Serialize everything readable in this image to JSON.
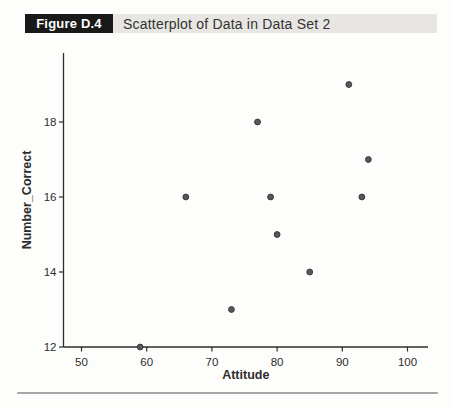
{
  "figure": {
    "label": "Figure D.4",
    "title": "Scatterplot of Data in Data Set 2"
  },
  "chart_data": {
    "type": "scatter",
    "title": "Scatterplot of Data in Data Set 2",
    "xlabel": "Attitude",
    "ylabel": "Number_Correct",
    "xlim": [
      47.2,
      103.2
    ],
    "ylim": [
      12,
      19.85
    ],
    "x_ticks": [
      50,
      60,
      70,
      80,
      90,
      100
    ],
    "y_ticks": [
      12,
      14,
      16,
      18
    ],
    "grid": false,
    "legend": "none",
    "points": [
      {
        "x": 59,
        "y": 12
      },
      {
        "x": 66,
        "y": 16
      },
      {
        "x": 73,
        "y": 13
      },
      {
        "x": 77,
        "y": 18
      },
      {
        "x": 79,
        "y": 16
      },
      {
        "x": 80,
        "y": 15
      },
      {
        "x": 85,
        "y": 14
      },
      {
        "x": 91,
        "y": 19
      },
      {
        "x": 93,
        "y": 16
      },
      {
        "x": 94,
        "y": 17
      }
    ],
    "marker": {
      "shape": "circle",
      "fill": "#58585a",
      "edge": "#39393b"
    },
    "axis_color": "#2d2d2d"
  },
  "colors": {
    "caption_label_bg": "#191919",
    "caption_label_text": "#ffffff",
    "caption_bar_bg": "#e7e6e3",
    "caption_title_text": "#333333",
    "bottom_rule": "#a6a6a6",
    "page_background": "#fdfdfb"
  }
}
